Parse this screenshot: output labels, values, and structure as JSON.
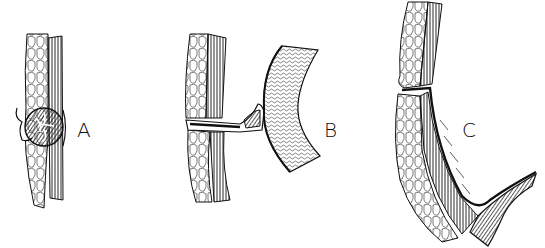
{
  "figure": {
    "panels": [
      {
        "id": "A",
        "label": "A"
      },
      {
        "id": "B",
        "label": "B"
      },
      {
        "id": "C",
        "label": "C"
      }
    ],
    "colors": {
      "ink": "#111111",
      "background": "#ffffff"
    }
  }
}
